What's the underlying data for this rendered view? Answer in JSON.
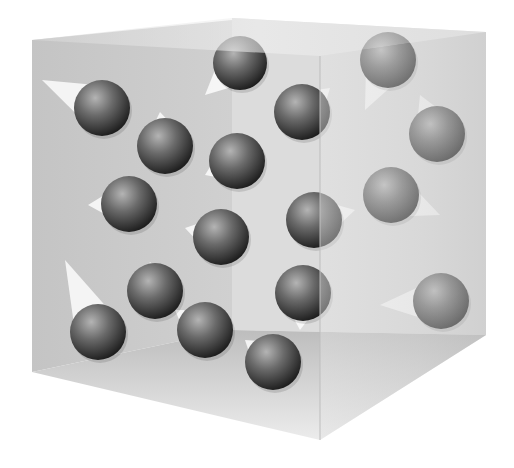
{
  "figure": {
    "colors": {
      "background": "#ffffff",
      "box_face": "#c8c8c8",
      "box_face_light": "#e6e6e6",
      "sphere_dark": "#2e2e2e",
      "sphere_mid": "#6a6a6a",
      "sphere_light": "#b4b4b4",
      "trail": "#ffffff"
    },
    "box": {
      "back_left_face": [
        [
          32,
          40
        ],
        [
          232,
          20
        ],
        [
          232,
          330
        ],
        [
          32,
          372
        ]
      ],
      "top_face": [
        [
          32,
          40
        ],
        [
          232,
          18
        ],
        [
          486,
          32
        ],
        [
          320,
          56
        ]
      ],
      "floor_face": [
        [
          32,
          372
        ],
        [
          232,
          330
        ],
        [
          486,
          335
        ],
        [
          320,
          440
        ]
      ],
      "right_face": [
        [
          320,
          56
        ],
        [
          486,
          32
        ],
        [
          486,
          335
        ],
        [
          320,
          440
        ]
      ],
      "inner_back_right_face": [
        [
          232,
          18
        ],
        [
          486,
          32
        ],
        [
          486,
          335
        ],
        [
          232,
          330
        ]
      ]
    },
    "particles": [
      {
        "cx": 240,
        "cy": 63,
        "r": 27,
        "trail": [
          [
            205,
            95
          ],
          [
            228,
            72
          ]
        ]
      },
      {
        "cx": 388,
        "cy": 60,
        "r": 28,
        "trail": [
          [
            365,
            110
          ],
          [
            380,
            80
          ]
        ]
      },
      {
        "cx": 102,
        "cy": 108,
        "r": 28,
        "trail": [
          [
            42,
            80
          ],
          [
            80,
            100
          ]
        ]
      },
      {
        "cx": 302,
        "cy": 112,
        "r": 28,
        "trail": [
          [
            330,
            88
          ],
          [
            318,
            100
          ]
        ]
      },
      {
        "cx": 165,
        "cy": 146,
        "r": 28,
        "trail": [
          [
            160,
            112
          ],
          [
            165,
            120
          ]
        ]
      },
      {
        "cx": 437,
        "cy": 134,
        "r": 28,
        "trail": [
          [
            420,
            95
          ],
          [
            430,
            108
          ]
        ]
      },
      {
        "cx": 237,
        "cy": 161,
        "r": 28,
        "trail": [
          [
            205,
            175
          ],
          [
            215,
            168
          ]
        ]
      },
      {
        "cx": 129,
        "cy": 204,
        "r": 28,
        "trail": [
          [
            88,
            205
          ],
          [
            105,
            205
          ]
        ]
      },
      {
        "cx": 391,
        "cy": 195,
        "r": 28,
        "trail": [
          [
            440,
            215
          ],
          [
            415,
            205
          ]
        ]
      },
      {
        "cx": 221,
        "cy": 237,
        "r": 28,
        "trail": [
          [
            185,
            228
          ],
          [
            198,
            232
          ]
        ]
      },
      {
        "cx": 314,
        "cy": 220,
        "r": 28,
        "trail": [
          [
            355,
            210
          ],
          [
            338,
            215
          ]
        ]
      },
      {
        "cx": 155,
        "cy": 291,
        "r": 28,
        "trail": [
          [
            150,
            262
          ],
          [
            152,
            268
          ]
        ]
      },
      {
        "cx": 303,
        "cy": 293,
        "r": 28,
        "trail": [
          [
            300,
            330
          ],
          [
            302,
            318
          ]
        ]
      },
      {
        "cx": 441,
        "cy": 301,
        "r": 28,
        "trail": [
          [
            380,
            305
          ],
          [
            412,
            303
          ]
        ]
      },
      {
        "cx": 98,
        "cy": 332,
        "r": 28,
        "trail": [
          [
            65,
            260
          ],
          [
            80,
            295
          ]
        ]
      },
      {
        "cx": 205,
        "cy": 330,
        "r": 28,
        "trail": [
          [
            175,
            310
          ],
          [
            185,
            318
          ]
        ]
      },
      {
        "cx": 273,
        "cy": 362,
        "r": 28,
        "trail": [
          [
            245,
            340
          ],
          [
            255,
            348
          ]
        ]
      }
    ]
  }
}
